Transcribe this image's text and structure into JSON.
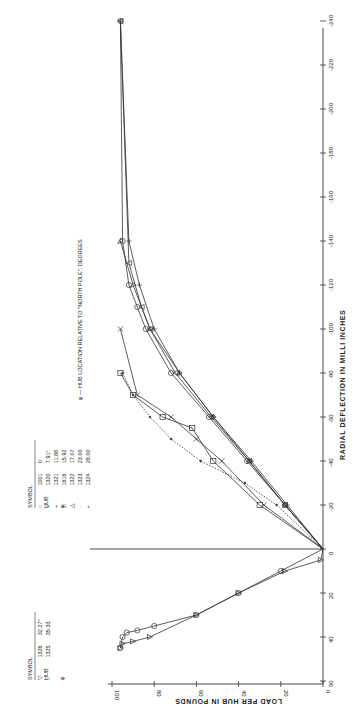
{
  "chart_data": {
    "type": "line",
    "orientation": "rotated 90 degrees counter-clockwise on page",
    "title": "",
    "xlabel": "RADIAL DEFLECTION IN MILLI INCHES",
    "ylabel": "LOAD PER HUB IN POUNDS",
    "x_ticks": [
      "-240",
      "-220",
      "-200",
      "-180",
      "-160",
      "-140",
      "-120",
      "-100",
      "-80",
      "-60",
      "-40",
      "-20",
      "0",
      "20",
      "40",
      "60"
    ],
    "y_ticks": [
      "0",
      "20",
      "40",
      "60",
      "80",
      "100"
    ],
    "xlim": [
      -240,
      60
    ],
    "ylim": [
      0,
      100
    ],
    "grid": false,
    "annotation": "φ — HUB LOCATION RELATIVE TO \"NORTH POLE\", DEGREES",
    "legend_negative": {
      "headers": [
        "SYMBOL",
        "HUB",
        "φ"
      ],
      "rows": [
        {
          "symbol": "circle",
          "glyph": "○",
          "hub": "1001",
          "phi": "0"
        },
        {
          "symbol": "x",
          "glyph": "×",
          "hub": "1320",
          "phi": "7.91°"
        },
        {
          "symbol": "plus",
          "glyph": "+",
          "hub": "1321",
          "phi": "11.88"
        },
        {
          "symbol": "square",
          "glyph": "□",
          "hub": "1616",
          "phi": "15.92"
        },
        {
          "symbol": "triangle",
          "glyph": "△",
          "hub": "1322",
          "phi": "17.07"
        },
        {
          "symbol": "dot",
          "glyph": "·",
          "hub": "1323",
          "phi": "23.00"
        },
        {
          "symbol": "flag",
          "glyph": "⌐",
          "hub": "1324",
          "phi": "28.00"
        }
      ]
    },
    "legend_positive": {
      "headers": [
        "SYMBOL",
        "HUB",
        "φ"
      ],
      "rows": [
        {
          "symbol": "triangle-down",
          "glyph": "▽",
          "hub": "1326",
          "phi": "32.27°"
        },
        {
          "symbol": "circle",
          "glyph": "○",
          "hub": "1325",
          "phi": "35.33"
        }
      ]
    },
    "series": [
      {
        "name": "1001 (φ=0)",
        "points": [
          [
            0,
            0
          ],
          [
            -20,
            18
          ],
          [
            -40,
            36
          ],
          [
            -60,
            54
          ],
          [
            -80,
            72
          ],
          [
            -100,
            84
          ],
          [
            -110,
            88
          ],
          [
            -120,
            92
          ],
          [
            -140,
            95
          ],
          [
            -240,
            96
          ]
        ]
      },
      {
        "name": "1320 (φ=7.91)",
        "points": [
          [
            0,
            0
          ],
          [
            -20,
            28
          ],
          [
            -40,
            48
          ],
          [
            -50,
            60
          ],
          [
            -60,
            72
          ],
          [
            -70,
            88
          ],
          [
            -100,
            96
          ]
        ]
      },
      {
        "name": "1321 (φ=11.88)",
        "points": [
          [
            0,
            0
          ],
          [
            -20,
            17
          ],
          [
            -40,
            34
          ],
          [
            -60,
            52
          ],
          [
            -80,
            68
          ],
          [
            -100,
            80
          ],
          [
            -120,
            87
          ],
          [
            -140,
            92
          ],
          [
            -240,
            96
          ]
        ]
      },
      {
        "name": "1616 (φ=15.92)",
        "points": [
          [
            0,
            0
          ],
          [
            -20,
            30
          ],
          [
            -40,
            52
          ],
          [
            -55,
            62
          ],
          [
            -60,
            76
          ],
          [
            -70,
            90
          ],
          [
            -80,
            96
          ]
        ]
      },
      {
        "name": "1322 (φ=17.07)",
        "points": [
          [
            0,
            0
          ],
          [
            -20,
            18
          ],
          [
            -40,
            35
          ],
          [
            -60,
            53
          ],
          [
            -80,
            70
          ],
          [
            -100,
            82
          ],
          [
            -110,
            86
          ],
          [
            -130,
            92
          ],
          [
            -240,
            96
          ]
        ]
      },
      {
        "name": "1323 (φ=23.00)",
        "points": [
          [
            0,
            0
          ],
          [
            -20,
            22
          ],
          [
            -30,
            37
          ],
          [
            -40,
            58
          ],
          [
            -50,
            72
          ],
          [
            -60,
            82
          ],
          [
            -70,
            90
          ],
          [
            -80,
            95
          ]
        ]
      },
      {
        "name": "1324 (φ=28.00)",
        "points": [
          [
            0,
            0
          ],
          [
            -20,
            18
          ],
          [
            -40,
            35
          ],
          [
            -60,
            52
          ],
          [
            -80,
            68
          ],
          [
            -100,
            82
          ],
          [
            -120,
            90
          ],
          [
            -140,
            96
          ]
        ]
      },
      {
        "name": "1326 (φ=32.27)",
        "points": [
          [
            0,
            0
          ],
          [
            5,
            1
          ],
          [
            10,
            18
          ],
          [
            20,
            40
          ],
          [
            30,
            60
          ],
          [
            40,
            82
          ],
          [
            42,
            90
          ],
          [
            43,
            95
          ],
          [
            45,
            96
          ]
        ]
      },
      {
        "name": "1325 (φ=35.33)",
        "points": [
          [
            0,
            0
          ],
          [
            10,
            20
          ],
          [
            20,
            40
          ],
          [
            30,
            60
          ],
          [
            35,
            80
          ],
          [
            37,
            88
          ],
          [
            38,
            93
          ],
          [
            40,
            95
          ],
          [
            45,
            96
          ]
        ]
      }
    ]
  }
}
